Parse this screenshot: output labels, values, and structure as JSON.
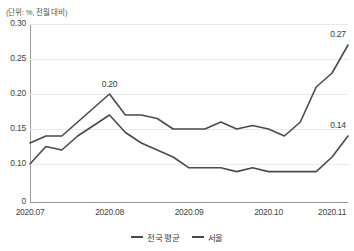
{
  "unit_note": "(단위: %, 전월 대비)",
  "chart_data": {
    "type": "line",
    "title": "",
    "subtitle": "",
    "unit_note": "(단위: %, 전월 대비)",
    "xlabel": "",
    "ylabel": "",
    "ylim": [
      0,
      0.3
    ],
    "y_ticks": [
      "0.30",
      "0.25",
      "0.20",
      "0.15",
      "0.10",
      "0"
    ],
    "y_tick_values": [
      0.3,
      0.25,
      0.2,
      0.15,
      0.1,
      0.0
    ],
    "grid": true,
    "legend_position": "bottom",
    "x_ticks": [
      "2020.07",
      "2020.08",
      "2020.09",
      "2020.10",
      "2020.11"
    ],
    "x_tick_index": [
      0,
      5,
      10,
      15,
      19
    ],
    "x": [
      0,
      1,
      2,
      3,
      4,
      5,
      6,
      7,
      8,
      9,
      10,
      11,
      12,
      13,
      14,
      15,
      16,
      17,
      18,
      19,
      20
    ],
    "series": [
      {
        "name": "전국 평균",
        "color": "#4a4a4a",
        "values": [
          0.13,
          0.14,
          0.14,
          0.16,
          0.18,
          0.2,
          0.17,
          0.17,
          0.165,
          0.15,
          0.15,
          0.15,
          0.16,
          0.15,
          0.155,
          0.15,
          0.14,
          0.16,
          0.21,
          0.23,
          0.27
        ]
      },
      {
        "name": "서울",
        "color": "#4a4a4a",
        "values": [
          0.1,
          0.125,
          0.12,
          0.14,
          0.155,
          0.17,
          0.145,
          0.13,
          0.12,
          0.11,
          0.09,
          0.09,
          0.09,
          0.08,
          0.09,
          0.08,
          0.08,
          0.08,
          0.08,
          0.11,
          0.14
        ]
      }
    ],
    "annotations": [
      {
        "text": "0.20",
        "series": "전국 평균",
        "x_index": 5,
        "value": 0.2
      },
      {
        "text": "0.27",
        "series": "전국 평균",
        "x_index": 20,
        "value": 0.27
      },
      {
        "text": "0.14",
        "series": "서울",
        "x_index": 20,
        "value": 0.14
      }
    ]
  },
  "legend": {
    "items": [
      {
        "label": "전국 평균"
      },
      {
        "label": "서울"
      }
    ]
  }
}
